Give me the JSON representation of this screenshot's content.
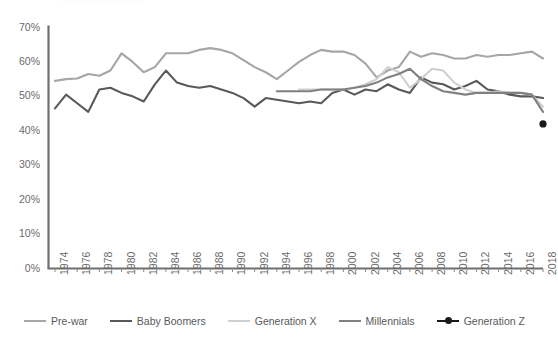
{
  "ghost_header": "Homeownership",
  "chart_data": {
    "type": "line",
    "title": "",
    "xlabel": "",
    "ylabel": "",
    "ylim": [
      0,
      70
    ],
    "ytick_labels": [
      "0%",
      "10%",
      "20%",
      "30%",
      "40%",
      "50%",
      "60%",
      "70%"
    ],
    "ytick_values": [
      0,
      10,
      20,
      30,
      40,
      50,
      60,
      70
    ],
    "grid": false,
    "legend_position": "bottom",
    "xlim": [
      1974,
      2018
    ],
    "xtick_labels": [
      "1974",
      "1976",
      "1978",
      "1980",
      "1982",
      "1984",
      "1986",
      "1988",
      "1990",
      "1992",
      "1994",
      "1996",
      "1998",
      "2000",
      "2002",
      "2004",
      "2006",
      "2008",
      "2010",
      "2012",
      "2014",
      "2016",
      "2018"
    ],
    "xtick_values": [
      1974,
      1976,
      1978,
      1980,
      1982,
      1984,
      1986,
      1988,
      1990,
      1992,
      1994,
      1996,
      1998,
      2000,
      2002,
      2004,
      2006,
      2008,
      2010,
      2012,
      2014,
      2016,
      2018
    ],
    "colors": {
      "pre_war": "#a6a6a6",
      "baby_boomers": "#595959",
      "generation_x": "#cfcfcf",
      "millennials": "#808080",
      "generation_z": "#1a1a1a"
    },
    "series": [
      {
        "name": "Pre-war",
        "color": "#a6a6a6",
        "marker": false,
        "x": [
          1974,
          1975,
          1976,
          1977,
          1978,
          1979,
          1980,
          1981,
          1982,
          1983,
          1984,
          1985,
          1986,
          1987,
          1988,
          1989,
          1990,
          1991,
          1992,
          1993,
          1994,
          1995,
          1996,
          1997,
          1998,
          1999,
          2000,
          2001,
          2002,
          2003,
          2004,
          2005,
          2006,
          2007,
          2008,
          2009,
          2010,
          2011,
          2012,
          2013,
          2014,
          2015,
          2016,
          2017,
          2018
        ],
        "values": [
          54.5,
          55.0,
          55.2,
          56.5,
          56.0,
          57.5,
          62.5,
          60.0,
          57.0,
          58.5,
          62.5,
          62.5,
          62.5,
          63.5,
          64.0,
          63.5,
          62.5,
          60.5,
          58.5,
          57.0,
          55.0,
          57.5,
          60.0,
          62.0,
          63.5,
          63.0,
          63.0,
          62.0,
          59.5,
          55.5,
          57.5,
          58.5,
          63.0,
          61.5,
          62.5,
          62.0,
          61.0,
          61.0,
          62.0,
          61.5,
          62.0,
          62.0,
          62.5,
          63.0,
          61.0
        ]
      },
      {
        "name": "Baby Boomers",
        "color": "#595959",
        "marker": false,
        "x": [
          1974,
          1975,
          1976,
          1977,
          1978,
          1979,
          1980,
          1981,
          1982,
          1983,
          1984,
          1985,
          1986,
          1987,
          1988,
          1989,
          1990,
          1991,
          1992,
          1993,
          1994,
          1995,
          1996,
          1997,
          1998,
          1999,
          2000,
          2001,
          2002,
          2003,
          2004,
          2005,
          2006,
          2007,
          2008,
          2009,
          2010,
          2011,
          2012,
          2013,
          2014,
          2015,
          2016,
          2017,
          2018
        ],
        "values": [
          46.5,
          50.5,
          48.0,
          45.5,
          52.0,
          52.5,
          51.0,
          50.0,
          48.5,
          53.5,
          57.5,
          54.0,
          53.0,
          52.5,
          53.0,
          52.0,
          51.0,
          49.5,
          47.0,
          49.5,
          49.0,
          48.5,
          48.0,
          48.5,
          48.0,
          51.0,
          52.0,
          50.5,
          52.0,
          51.5,
          53.5,
          52.0,
          51.0,
          55.5,
          54.0,
          53.5,
          52.0,
          53.0,
          54.5,
          52.0,
          51.5,
          50.5,
          50.0,
          50.0,
          49.5
        ]
      },
      {
        "name": "Generation X",
        "color": "#cfcfcf",
        "marker": false,
        "x": [
          1996,
          1997,
          1998,
          1999,
          2000,
          2001,
          2002,
          2003,
          2004,
          2005,
          2006,
          2007,
          2008,
          2009,
          2010,
          2011,
          2012,
          2013,
          2014,
          2015,
          2016,
          2017,
          2018
        ],
        "values": [
          52.0,
          52.0,
          52.0,
          52.0,
          52.0,
          52.5,
          53.5,
          55.0,
          58.5,
          57.0,
          52.5,
          55.0,
          58.0,
          57.5,
          54.0,
          52.0,
          51.0,
          51.0,
          51.5,
          51.0,
          51.0,
          50.5,
          47.0
        ]
      },
      {
        "name": "Millennials",
        "color": "#808080",
        "marker": false,
        "x": [
          1994,
          1995,
          1996,
          1997,
          1998,
          1999,
          2000,
          2001,
          2002,
          2003,
          2004,
          2005,
          2006,
          2007,
          2008,
          2009,
          2010,
          2011,
          2012,
          2013,
          2014,
          2015,
          2016,
          2017,
          2018
        ],
        "values": [
          51.5,
          51.5,
          51.5,
          51.5,
          52.0,
          52.0,
          52.0,
          52.5,
          53.0,
          54.0,
          55.5,
          56.5,
          58.0,
          55.0,
          53.0,
          51.5,
          51.0,
          50.5,
          51.0,
          51.0,
          51.0,
          51.0,
          51.0,
          50.5,
          45.5
        ]
      },
      {
        "name": "Generation Z",
        "color": "#1a1a1a",
        "marker": true,
        "x": [
          2018
        ],
        "values": [
          42.0
        ]
      }
    ],
    "legend": [
      {
        "label": "Pre-war",
        "color": "#a6a6a6",
        "marker": false
      },
      {
        "label": "Baby Boomers",
        "color": "#595959",
        "marker": false
      },
      {
        "label": "Generation X",
        "color": "#cfcfcf",
        "marker": false
      },
      {
        "label": "Millennials",
        "color": "#808080",
        "marker": false
      },
      {
        "label": "Generation Z",
        "color": "#1a1a1a",
        "marker": true
      }
    ]
  }
}
